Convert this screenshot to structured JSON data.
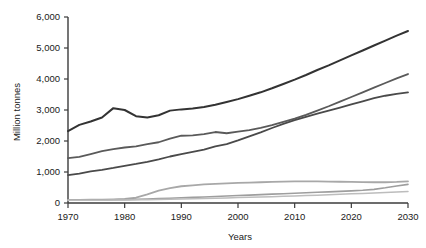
{
  "chart_data": {
    "type": "line",
    "title": "",
    "xlabel": "Years",
    "ylabel": "Million tonnes",
    "xlim": [
      1970,
      2030
    ],
    "ylim": [
      0,
      6000
    ],
    "grid": false,
    "legend": "none",
    "x_ticks": [
      "1970",
      "1980",
      "1990",
      "2000",
      "2010",
      "2020",
      "2030"
    ],
    "x_tick_values": [
      1970,
      1980,
      1990,
      2000,
      2010,
      2020,
      2030
    ],
    "y_ticks": [
      "0",
      "1,000",
      "2,000",
      "3,000",
      "4,000",
      "5,000",
      "6,000"
    ],
    "y_tick_values": [
      0,
      1000,
      2000,
      3000,
      4000,
      5000,
      6000
    ],
    "x": [
      1970,
      1972,
      1974,
      1976,
      1978,
      1980,
      1982,
      1984,
      1986,
      1988,
      1990,
      1992,
      1994,
      1996,
      1998,
      2000,
      2002,
      2004,
      2006,
      2008,
      2010,
      2012,
      2014,
      2016,
      2018,
      2020,
      2022,
      2024,
      2026,
      2028,
      2030
    ],
    "series": [
      {
        "name": "series-1",
        "color": "#333333",
        "width": 2.0,
        "values": [
          2320,
          2520,
          2630,
          2760,
          3060,
          3000,
          2800,
          2760,
          2830,
          2980,
          3020,
          3050,
          3100,
          3170,
          3260,
          3350,
          3460,
          3570,
          3700,
          3840,
          3980,
          4130,
          4290,
          4440,
          4600,
          4760,
          4920,
          5080,
          5240,
          5400,
          5550
        ]
      },
      {
        "name": "series-2",
        "color": "#5a5a5a",
        "width": 1.8,
        "values": [
          1450,
          1490,
          1580,
          1670,
          1740,
          1790,
          1830,
          1900,
          1960,
          2080,
          2170,
          2180,
          2220,
          2290,
          2250,
          2300,
          2350,
          2420,
          2510,
          2620,
          2720,
          2840,
          2980,
          3120,
          3270,
          3420,
          3570,
          3720,
          3870,
          4020,
          4160
        ]
      },
      {
        "name": "series-3",
        "color": "#4a4a4a",
        "width": 1.8,
        "values": [
          900,
          950,
          1020,
          1070,
          1130,
          1200,
          1260,
          1330,
          1410,
          1500,
          1580,
          1650,
          1720,
          1830,
          1900,
          2020,
          2150,
          2280,
          2420,
          2550,
          2670,
          2780,
          2880,
          2980,
          3080,
          3180,
          3280,
          3380,
          3460,
          3520,
          3570
        ]
      },
      {
        "name": "series-4",
        "color": "#a8a8a8",
        "width": 1.8,
        "values": [
          100,
          100,
          105,
          110,
          120,
          135,
          170,
          280,
          400,
          480,
          540,
          570,
          600,
          620,
          635,
          650,
          660,
          670,
          680,
          690,
          700,
          700,
          695,
          690,
          685,
          680,
          675,
          670,
          670,
          680,
          700
        ]
      },
      {
        "name": "series-5",
        "color": "#9e9e9e",
        "width": 1.6,
        "values": [
          95,
          95,
          98,
          100,
          105,
          110,
          118,
          128,
          140,
          155,
          170,
          180,
          195,
          210,
          225,
          240,
          255,
          270,
          285,
          300,
          315,
          330,
          345,
          360,
          375,
          390,
          410,
          440,
          490,
          550,
          600
        ]
      },
      {
        "name": "series-6",
        "color": "#bdbdbd",
        "width": 1.5,
        "values": [
          90,
          90,
          90,
          92,
          95,
          98,
          102,
          108,
          115,
          122,
          130,
          138,
          146,
          155,
          165,
          175,
          185,
          195,
          205,
          215,
          225,
          238,
          252,
          266,
          280,
          295,
          310,
          325,
          340,
          355,
          370
        ]
      }
    ]
  }
}
